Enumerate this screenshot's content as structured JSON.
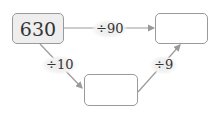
{
  "diagram": {
    "start_box": {
      "value": "630"
    },
    "right_box": {
      "value": ""
    },
    "bottom_box": {
      "value": ""
    },
    "operations": {
      "top": "÷90",
      "left_down": "÷10",
      "right_up": "÷9"
    },
    "colors": {
      "box_border": "#9a9a9a",
      "filled_box_bg": "#eeeeee",
      "line": "#9a9a9a"
    }
  }
}
